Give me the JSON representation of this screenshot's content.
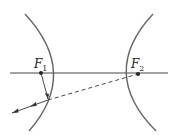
{
  "diagram": {
    "type": "hyperbola-reflection",
    "foci": [
      {
        "name": "F",
        "subscript": "1",
        "x": 41,
        "y": 73
      },
      {
        "name": "F",
        "subscript": "2",
        "x": 138,
        "y": 74
      }
    ],
    "colors": {
      "curve": "#555555",
      "line": "#333333"
    }
  }
}
